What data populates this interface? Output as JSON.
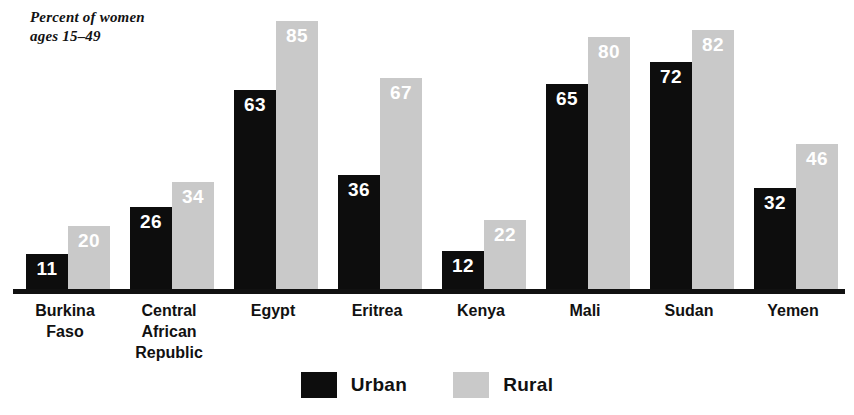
{
  "chart_data": {
    "type": "bar",
    "title": "Percent of women\nages 15–49",
    "xlabel": "",
    "ylabel": "Percent of women ages 15-49",
    "ylim": [
      0,
      90
    ],
    "grid": false,
    "legend_position": "bottom-center",
    "categories": [
      "Burkina\nFaso",
      "Central\nAfrican\nRepublic",
      "Egypt",
      "Eritrea",
      "Kenya",
      "Mali",
      "Sudan",
      "Yemen"
    ],
    "series": [
      {
        "name": "Urban",
        "color": "#0d0d0d",
        "values": [
          11,
          26,
          63,
          36,
          12,
          65,
          72,
          32
        ]
      },
      {
        "name": "Rural",
        "color": "#c9c9c9",
        "values": [
          20,
          34,
          85,
          67,
          22,
          80,
          82,
          46
        ]
      }
    ]
  },
  "legend": {
    "items": [
      {
        "label": "Urban",
        "swatch": "urban"
      },
      {
        "label": "Rural",
        "swatch": "rural"
      }
    ]
  },
  "colors": {
    "urban": "#0d0d0d",
    "rural": "#c9c9c9",
    "axis": "#111111",
    "value_text": "#ffffff",
    "background": "#ffffff"
  }
}
